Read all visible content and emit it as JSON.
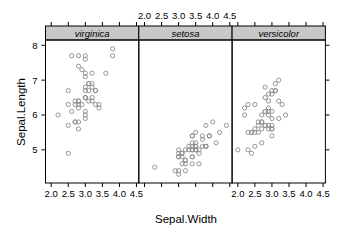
{
  "chart_data": {
    "type": "scatter",
    "title": "",
    "xlabel": "Sepal.Width",
    "ylabel": "Sepal.Length",
    "xlim": [
      1.832,
      4.568
    ],
    "ylim": [
      4.048,
      8.152
    ],
    "x_ticks": [
      2.0,
      2.5,
      3.0,
      3.5,
      4.0,
      4.5
    ],
    "x_tick_labels": [
      "2.0",
      "2.5",
      "3.0",
      "3.5",
      "4.0",
      "4.5"
    ],
    "y_ticks": [
      5,
      6,
      7,
      8
    ],
    "y_tick_labels": [
      "5",
      "6",
      "7",
      "8"
    ],
    "grid": false,
    "legend": "none",
    "layout": "3 panels side by side, conditioned on species",
    "point_color": "#8a8a8a",
    "strip_color": "#c8c8c8",
    "panels": [
      {
        "name": "virginica",
        "x_axis_labels": "bottom",
        "points": [
          [
            3.3,
            6.3
          ],
          [
            2.7,
            5.8
          ],
          [
            3.0,
            7.1
          ],
          [
            2.9,
            6.3
          ],
          [
            3.0,
            6.5
          ],
          [
            3.0,
            7.6
          ],
          [
            2.5,
            4.9
          ],
          [
            2.9,
            7.3
          ],
          [
            2.5,
            6.7
          ],
          [
            3.6,
            7.2
          ],
          [
            3.2,
            6.5
          ],
          [
            2.7,
            6.4
          ],
          [
            3.0,
            6.8
          ],
          [
            2.5,
            5.7
          ],
          [
            2.8,
            5.8
          ],
          [
            3.2,
            6.4
          ],
          [
            3.0,
            6.5
          ],
          [
            3.8,
            7.7
          ],
          [
            2.6,
            7.7
          ],
          [
            2.2,
            6.0
          ],
          [
            3.2,
            6.9
          ],
          [
            2.8,
            5.6
          ],
          [
            2.8,
            7.7
          ],
          [
            2.7,
            6.3
          ],
          [
            3.3,
            6.7
          ],
          [
            3.2,
            7.2
          ],
          [
            2.8,
            6.2
          ],
          [
            3.0,
            6.1
          ],
          [
            2.8,
            6.4
          ],
          [
            3.0,
            7.2
          ],
          [
            2.8,
            7.4
          ],
          [
            3.8,
            7.9
          ],
          [
            2.8,
            6.4
          ],
          [
            2.8,
            6.3
          ],
          [
            2.6,
            6.1
          ],
          [
            3.0,
            7.7
          ],
          [
            3.4,
            6.3
          ],
          [
            3.1,
            6.4
          ],
          [
            3.0,
            6.0
          ],
          [
            3.1,
            6.9
          ],
          [
            3.1,
            6.7
          ],
          [
            3.1,
            6.9
          ],
          [
            2.7,
            5.8
          ],
          [
            3.2,
            6.8
          ],
          [
            3.3,
            6.7
          ],
          [
            3.0,
            6.7
          ],
          [
            2.5,
            6.3
          ],
          [
            3.0,
            6.5
          ],
          [
            3.4,
            6.2
          ],
          [
            3.0,
            5.9
          ]
        ]
      },
      {
        "name": "setosa",
        "x_axis_labels": "top",
        "points": [
          [
            3.5,
            5.1
          ],
          [
            3.0,
            4.9
          ],
          [
            3.2,
            4.7
          ],
          [
            3.1,
            4.6
          ],
          [
            3.6,
            5.0
          ],
          [
            3.9,
            5.4
          ],
          [
            3.4,
            4.6
          ],
          [
            3.4,
            5.0
          ],
          [
            2.9,
            4.4
          ],
          [
            3.1,
            4.9
          ],
          [
            3.7,
            5.4
          ],
          [
            3.4,
            4.8
          ],
          [
            3.0,
            4.8
          ],
          [
            3.0,
            4.3
          ],
          [
            4.0,
            5.8
          ],
          [
            4.4,
            5.7
          ],
          [
            3.9,
            5.4
          ],
          [
            3.5,
            5.1
          ],
          [
            3.8,
            5.7
          ],
          [
            3.8,
            5.1
          ],
          [
            3.4,
            5.4
          ],
          [
            3.7,
            5.1
          ],
          [
            3.6,
            4.6
          ],
          [
            3.3,
            5.1
          ],
          [
            3.4,
            4.8
          ],
          [
            3.0,
            5.0
          ],
          [
            3.4,
            5.0
          ],
          [
            3.5,
            5.2
          ],
          [
            3.4,
            5.2
          ],
          [
            3.2,
            4.7
          ],
          [
            3.1,
            4.8
          ],
          [
            3.4,
            5.4
          ],
          [
            4.1,
            5.2
          ],
          [
            4.2,
            5.5
          ],
          [
            3.1,
            4.9
          ],
          [
            3.2,
            5.0
          ],
          [
            3.5,
            5.5
          ],
          [
            3.6,
            4.9
          ],
          [
            3.0,
            4.4
          ],
          [
            3.4,
            5.1
          ],
          [
            3.5,
            5.0
          ],
          [
            2.3,
            4.5
          ],
          [
            3.2,
            4.4
          ],
          [
            3.5,
            5.0
          ],
          [
            3.8,
            5.1
          ],
          [
            3.0,
            4.8
          ],
          [
            3.8,
            5.1
          ],
          [
            3.2,
            4.6
          ],
          [
            3.7,
            5.3
          ],
          [
            3.3,
            5.0
          ]
        ]
      },
      {
        "name": "versicolor",
        "x_axis_labels": "bottom",
        "points": [
          [
            3.2,
            7.0
          ],
          [
            3.2,
            6.4
          ],
          [
            3.1,
            6.9
          ],
          [
            2.3,
            5.5
          ],
          [
            2.8,
            6.5
          ],
          [
            2.8,
            5.7
          ],
          [
            3.3,
            6.3
          ],
          [
            2.4,
            4.9
          ],
          [
            2.9,
            6.6
          ],
          [
            2.7,
            5.2
          ],
          [
            2.0,
            5.0
          ],
          [
            3.0,
            5.9
          ],
          [
            2.2,
            6.0
          ],
          [
            2.9,
            6.1
          ],
          [
            2.9,
            5.6
          ],
          [
            3.1,
            6.7
          ],
          [
            3.0,
            5.6
          ],
          [
            2.7,
            5.8
          ],
          [
            2.2,
            6.2
          ],
          [
            2.5,
            5.6
          ],
          [
            3.2,
            5.9
          ],
          [
            2.8,
            6.1
          ],
          [
            2.5,
            6.3
          ],
          [
            2.8,
            6.1
          ],
          [
            2.9,
            6.4
          ],
          [
            3.0,
            6.6
          ],
          [
            2.8,
            6.8
          ],
          [
            3.0,
            6.7
          ],
          [
            2.9,
            6.0
          ],
          [
            2.6,
            5.7
          ],
          [
            2.4,
            5.5
          ],
          [
            2.4,
            5.5
          ],
          [
            2.7,
            5.8
          ],
          [
            2.7,
            6.0
          ],
          [
            3.0,
            5.4
          ],
          [
            3.4,
            6.0
          ],
          [
            3.1,
            6.7
          ],
          [
            2.3,
            6.3
          ],
          [
            3.0,
            5.6
          ],
          [
            2.5,
            5.5
          ],
          [
            2.6,
            5.5
          ],
          [
            3.0,
            6.1
          ],
          [
            2.6,
            5.8
          ],
          [
            2.3,
            5.0
          ],
          [
            2.7,
            5.6
          ],
          [
            3.0,
            5.7
          ],
          [
            2.9,
            5.7
          ],
          [
            2.9,
            6.2
          ],
          [
            2.5,
            5.1
          ],
          [
            2.8,
            5.7
          ]
        ]
      }
    ]
  }
}
